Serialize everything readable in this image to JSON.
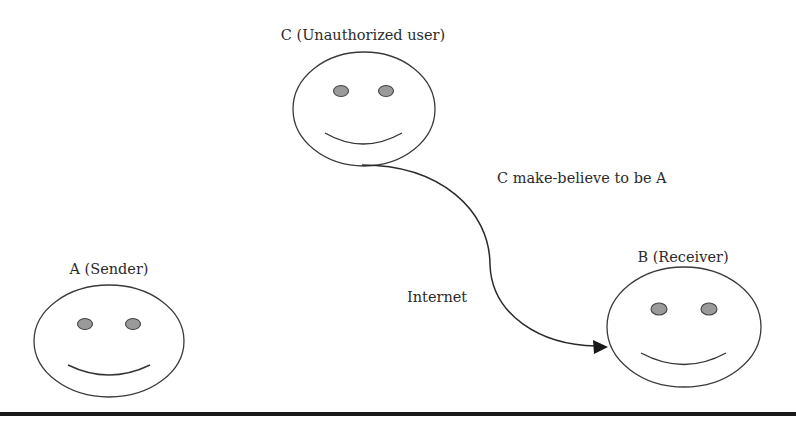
{
  "diagram": {
    "title": "",
    "actors": [
      {
        "id": "A",
        "label": "A (Sender)",
        "role": "sender",
        "face": {
          "cx": 109,
          "cy": 341,
          "rx": 75,
          "ry": 56
        },
        "label_pos": {
          "x": 109,
          "y": 274
        }
      },
      {
        "id": "B",
        "label": "B (Receiver)",
        "role": "receiver",
        "face": {
          "cx": 684,
          "cy": 327,
          "rx": 77,
          "ry": 60
        },
        "label_pos": {
          "x": 683,
          "y": 262
        }
      },
      {
        "id": "C",
        "label": "C (Unauthorized user)",
        "role": "unauthorized-user",
        "face": {
          "cx": 364,
          "cy": 109,
          "rx": 71,
          "ry": 57
        },
        "label_pos": {
          "x": 363,
          "y": 40
        }
      }
    ],
    "connections": [
      {
        "from": "C",
        "to": "B",
        "style": "curved-arrow",
        "annotation": "C make-believe to be A",
        "channel_label": "Internet"
      }
    ],
    "annotations": {
      "impersonation": "C make-believe to be A",
      "channel": "Internet"
    },
    "colors": {
      "stroke": "#333333",
      "eye_fill": "#9a9a9a",
      "text": "#2b2b2b",
      "background": "#ffffff",
      "rule": "#1a1a1a"
    }
  }
}
